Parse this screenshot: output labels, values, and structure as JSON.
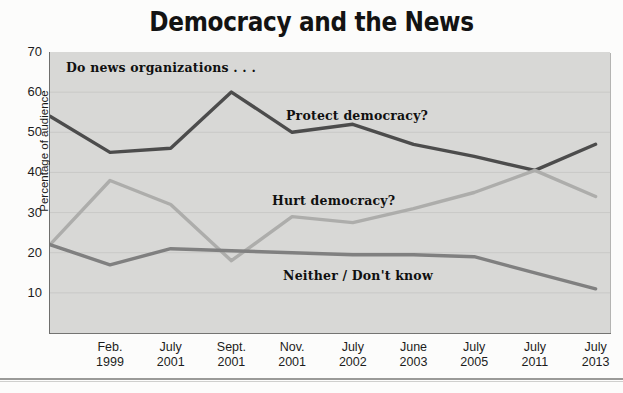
{
  "chart_data": {
    "type": "line",
    "title": "Democracy and the News",
    "xlabel": "",
    "ylabel": "Percentage of audience",
    "ylim": [
      0,
      70
    ],
    "yticks": [
      10,
      20,
      30,
      40,
      50,
      60,
      70
    ],
    "grid": true,
    "legend_position": "inline-annotations",
    "categories": [
      "Feb.\n1999",
      "July\n2001",
      "Sept.\n2001",
      "Nov.\n2001",
      "July\n2002",
      "June\n2003",
      "July\n2005",
      "July\n2011",
      "July\n2013"
    ],
    "tick_labels": [
      {
        "month": "Feb.",
        "year": "1999"
      },
      {
        "month": "July",
        "year": "2001"
      },
      {
        "month": "Sept.",
        "year": "2001"
      },
      {
        "month": "Nov.",
        "year": "2001"
      },
      {
        "month": "July",
        "year": "2002"
      },
      {
        "month": "June",
        "year": "2003"
      },
      {
        "month": "July",
        "year": "2005"
      },
      {
        "month": "July",
        "year": "2011"
      },
      {
        "month": "July",
        "year": "2013"
      }
    ],
    "series": [
      {
        "name": "Protect democracy?",
        "color": "#4c4c4c",
        "start_value": 54,
        "values": [
          45,
          46,
          60,
          50,
          52,
          47,
          44,
          40.5,
          47
        ]
      },
      {
        "name": "Hurt democracy?",
        "color": "#adadab",
        "start_value": 22,
        "values": [
          38,
          32,
          18,
          29,
          27.5,
          31,
          35,
          40.5,
          34
        ]
      },
      {
        "name": "Neither / Don't know",
        "color": "#808080",
        "start_value": 22,
        "values": [
          17,
          21,
          20.5,
          20,
          19.5,
          19.5,
          19,
          15,
          11
        ]
      }
    ],
    "annotations": [
      {
        "text": "Do news organizations . . .",
        "x_px": 66,
        "y_px": 60
      },
      {
        "text": "Protect democracy?",
        "x_px": 286,
        "y_px": 108
      },
      {
        "text": "Hurt democracy?",
        "x_px": 272,
        "y_px": 193
      },
      {
        "text": "Neither / Don't know",
        "x_px": 283,
        "y_px": 268
      }
    ]
  },
  "colors": {
    "plot_background": "#d8d8d6",
    "page_background": "#fcfcfb",
    "axis": "#6f6f6d",
    "gridline": "#c9c9c7",
    "text": "#1c1c1c",
    "protect_line": "#4c4c4c",
    "hurt_line": "#adadab",
    "neither_line": "#808080"
  }
}
